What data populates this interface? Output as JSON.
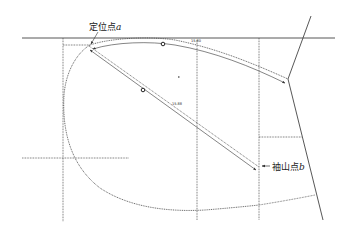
{
  "diagram": {
    "type": "pattern-drafting-armhole",
    "labels": {
      "point_a_text": "定位点",
      "point_a_var": "a",
      "point_b_text": "袖山点",
      "point_b_var": "b"
    },
    "measurements": {
      "top_curve": "15.80",
      "diagonal": "15.88"
    },
    "colors": {
      "line": "#333333",
      "background": "#ffffff"
    }
  }
}
